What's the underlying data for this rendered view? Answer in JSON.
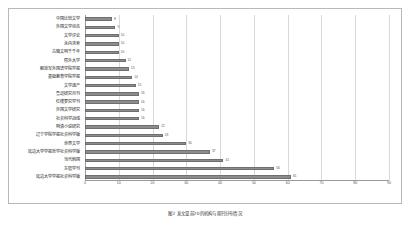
{
  "caption": "图2 发文量前20的机构与期刊分布情况",
  "chart_data": {
    "type": "bar",
    "orientation": "horizontal",
    "title": "",
    "xlabel": "",
    "ylabel": "",
    "xlim": [
      0,
      90
    ],
    "xticks": [
      0,
      10,
      20,
      30,
      40,
      50,
      60,
      70,
      80,
      90
    ],
    "grid": true,
    "legend": false,
    "bar_color": "#8c8c8c",
    "bar_edge_color": "#6f6f6f",
    "categories": [
      "中国比较文学",
      "外国文学动态",
      "文学评论",
      "永内求索",
      "古籍文明千千年",
      "陨外大学",
      "解放军外国语学院学报",
      "基础教育学院学报",
      "文学遗产",
      "鲁迅研究月刊",
      "红楼梦究学刊",
      "外国文学研究",
      "社会科学战线",
      "明清小说研究",
      "辽宁学院学报社会科学版",
      "世界文学",
      "延边大学学报哲学社会科学版",
      "当代韩国",
      "东疆学刊",
      "延边大学学报社会科学版"
    ],
    "values": [
      8,
      9,
      10,
      10,
      10,
      12,
      13,
      14,
      15,
      16,
      16,
      16,
      16,
      22,
      23,
      30,
      37,
      41,
      56,
      61
    ],
    "value_labels": [
      "8",
      "9",
      "10",
      "10",
      "10",
      "12",
      "13",
      "14",
      "15",
      "16",
      "16",
      "16",
      "16",
      "22",
      "23",
      "30",
      "37",
      "41",
      "56",
      "61"
    ]
  }
}
